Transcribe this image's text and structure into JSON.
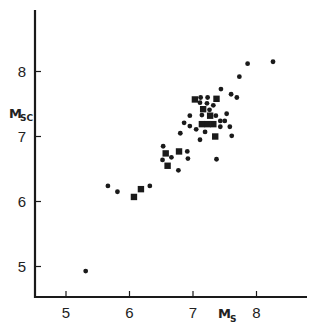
{
  "chart_data": {
    "type": "scatter",
    "title": "",
    "xlabel": "Ms",
    "xlabel_main": "M",
    "xlabel_sub": "S",
    "ylabel": "Msc",
    "ylabel_main": "M",
    "ylabel_sub": "SC",
    "xlim": [
      4.55,
      8.9
    ],
    "ylim": [
      4.55,
      9.0
    ],
    "xticks": [
      5,
      6,
      7,
      8
    ],
    "yticks": [
      5,
      6,
      7,
      8
    ],
    "xtick_labels": [
      "5",
      "6",
      "7",
      "8"
    ],
    "ytick_labels": [
      "5",
      "6",
      "7",
      "8"
    ],
    "grid": false,
    "legend": null,
    "series": [
      {
        "name": "circles",
        "marker": "circle",
        "color": "#1a1a1a",
        "points": [
          [
            8.26,
            8.15
          ],
          [
            7.86,
            8.12
          ],
          [
            7.73,
            7.92
          ],
          [
            7.44,
            7.73
          ],
          [
            7.6,
            7.65
          ],
          [
            7.69,
            7.6
          ],
          [
            7.12,
            7.6
          ],
          [
            7.23,
            7.6
          ],
          [
            7.11,
            7.52
          ],
          [
            7.22,
            7.51
          ],
          [
            7.32,
            7.48
          ],
          [
            7.26,
            7.41
          ],
          [
            6.95,
            7.32
          ],
          [
            7.14,
            7.33
          ],
          [
            7.36,
            7.32
          ],
          [
            7.53,
            7.35
          ],
          [
            6.86,
            7.21
          ],
          [
            7.43,
            7.24
          ],
          [
            7.5,
            7.24
          ],
          [
            6.95,
            7.16
          ],
          [
            7.05,
            7.11
          ],
          [
            7.43,
            7.15
          ],
          [
            7.58,
            7.15
          ],
          [
            7.19,
            7.07
          ],
          [
            7.61,
            7.01
          ],
          [
            6.8,
            7.05
          ],
          [
            7.11,
            6.95
          ],
          [
            6.53,
            6.85
          ],
          [
            6.91,
            6.77
          ],
          [
            6.52,
            6.64
          ],
          [
            6.66,
            6.68
          ],
          [
            6.92,
            6.66
          ],
          [
            7.37,
            6.65
          ],
          [
            6.77,
            6.48
          ],
          [
            6.32,
            6.24
          ],
          [
            5.66,
            6.24
          ],
          [
            5.81,
            6.15
          ],
          [
            5.31,
            4.93
          ]
        ]
      },
      {
        "name": "squares",
        "marker": "square",
        "color": "#1a1a1a",
        "points": [
          [
            7.03,
            7.57
          ],
          [
            7.37,
            7.58
          ],
          [
            7.16,
            7.42
          ],
          [
            7.27,
            7.32
          ],
          [
            7.14,
            7.19
          ],
          [
            7.23,
            7.19
          ],
          [
            7.32,
            7.19
          ],
          [
            7.35,
            7.0
          ],
          [
            6.57,
            6.74
          ],
          [
            6.78,
            6.77
          ],
          [
            6.6,
            6.55
          ],
          [
            6.07,
            6.07
          ],
          [
            6.18,
            6.19
          ]
        ]
      }
    ]
  }
}
